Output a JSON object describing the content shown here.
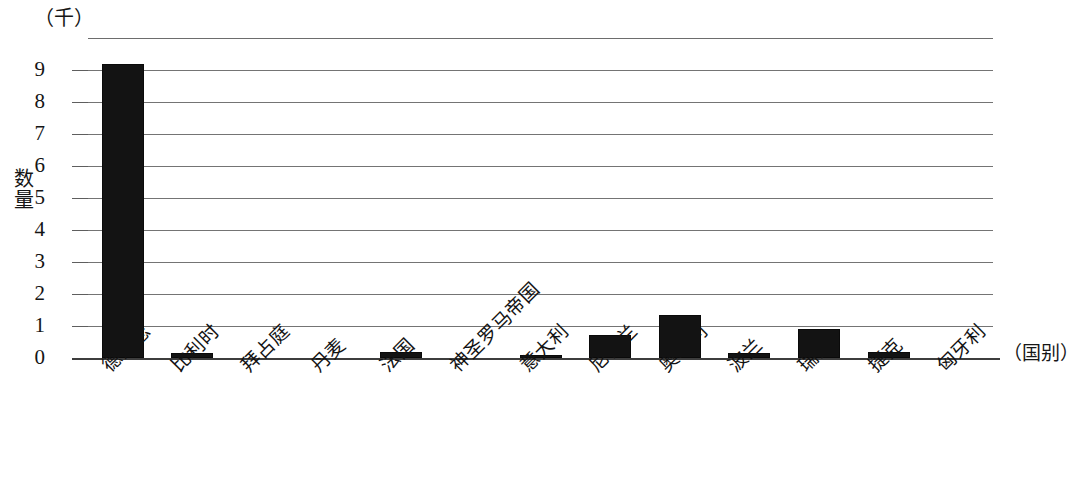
{
  "chart_data": {
    "type": "bar",
    "title": "",
    "subtitle": "",
    "xlabel": "（国别）",
    "ylabel": "数量",
    "unit_caption": "（千）",
    "categories": [
      "德意志",
      "比利时",
      "拜占庭",
      "丹麦",
      "法国",
      "神圣罗马帝国",
      "意大利",
      "尼德兰",
      "奥地利",
      "波兰",
      "瑞士",
      "捷克",
      "匈牙利"
    ],
    "values": [
      9.2,
      0.15,
      0,
      0,
      0.2,
      0,
      0.1,
      0.72,
      1.35,
      0.15,
      0.9,
      0.2,
      0
    ],
    "ylim": [
      0,
      10
    ],
    "ytick_labels": [
      "9",
      "8",
      "7",
      "6",
      "5",
      "4",
      "3",
      "2",
      "1",
      "0"
    ],
    "ytick_values": [
      9,
      8,
      7,
      6,
      5,
      4,
      3,
      2,
      1,
      0
    ],
    "gridlines": [
      10,
      9,
      8,
      7,
      6,
      5,
      4,
      3,
      2,
      1,
      0
    ],
    "grid": true,
    "legend": null,
    "legend_position": "none",
    "bar_color": "#131313",
    "grid_color": "#747474",
    "axis_color": "#3d3d3d",
    "label_rotation_deg": -45
  }
}
